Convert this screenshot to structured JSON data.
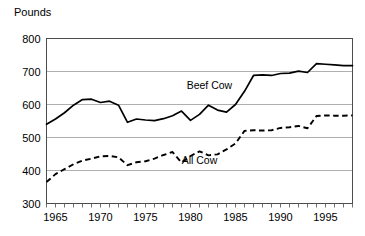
{
  "chart_data": {
    "type": "line",
    "title": "",
    "xlabel": "",
    "ylabel": "Pounds",
    "ylim": [
      300,
      800
    ],
    "xlim": [
      1964,
      1998
    ],
    "yticks": [
      300,
      400,
      500,
      600,
      700,
      800
    ],
    "xticks": [
      1965,
      1970,
      1975,
      1980,
      1985,
      1990,
      1995
    ],
    "x_minor_tick_step": 1,
    "grid": "horizontal",
    "legend": "inline-annotations",
    "annotations": [
      {
        "text": "Beef Cow",
        "x": 1982.1,
        "y": 648
      },
      {
        "text": "All Cow",
        "x": 1981.0,
        "y": 420
      }
    ],
    "series": [
      {
        "name": "Beef Cow",
        "style": "solid",
        "color": "#000000",
        "x": [
          1964,
          1965,
          1966,
          1967,
          1968,
          1969,
          1970,
          1971,
          1972,
          1973,
          1974,
          1975,
          1976,
          1977,
          1978,
          1979,
          1980,
          1981,
          1982,
          1983,
          1984,
          1985,
          1986,
          1987,
          1988,
          1989,
          1990,
          1991,
          1992,
          1993,
          1994,
          1995,
          1996,
          1997,
          1998
        ],
        "values": [
          540,
          556,
          575,
          598,
          615,
          616,
          606,
          610,
          598,
          546,
          556,
          553,
          551,
          557,
          566,
          580,
          552,
          570,
          598,
          583,
          577,
          600,
          640,
          688,
          690,
          688,
          694,
          695,
          701,
          697,
          724,
          722,
          720,
          718,
          718
        ]
      },
      {
        "name": "All Cow",
        "style": "dashed",
        "color": "#000000",
        "x": [
          1964,
          1965,
          1966,
          1967,
          1968,
          1969,
          1970,
          1971,
          1972,
          1973,
          1974,
          1975,
          1976,
          1977,
          1978,
          1979,
          1980,
          1981,
          1982,
          1983,
          1984,
          1985,
          1986,
          1987,
          1988,
          1989,
          1990,
          1991,
          1992,
          1993,
          1994,
          1995,
          1996,
          1997,
          1998
        ],
        "values": [
          365,
          389,
          404,
          419,
          430,
          436,
          443,
          444,
          440,
          416,
          425,
          428,
          436,
          447,
          456,
          424,
          444,
          458,
          446,
          449,
          464,
          482,
          520,
          522,
          521,
          522,
          529,
          531,
          535,
          528,
          565,
          567,
          566,
          566,
          567
        ]
      }
    ]
  },
  "axis": {
    "y_title": "Pounds"
  }
}
